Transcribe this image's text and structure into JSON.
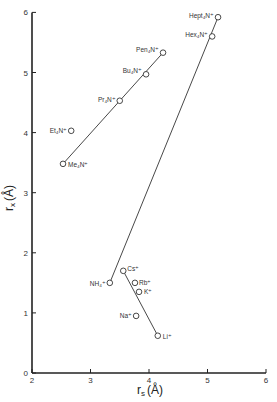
{
  "chart_data": {
    "type": "scatter",
    "title": "",
    "xlabel": "r_s (Å)",
    "ylabel": "r_x (Å)",
    "xlim": [
      2,
      6
    ],
    "ylim": [
      0,
      6
    ],
    "x_ticks": [
      "2",
      "3",
      "4",
      "5",
      "6"
    ],
    "y_ticks": [
      "0",
      "1",
      "2",
      "3",
      "4",
      "5",
      "6"
    ],
    "grid": false,
    "legend": null,
    "points": [
      {
        "label": "Hept₄N⁺",
        "x": 5.18,
        "y": 5.92
      },
      {
        "label": "Hex₄N⁺",
        "x": 5.08,
        "y": 5.6
      },
      {
        "label": "Pen₄N⁺",
        "x": 4.24,
        "y": 5.33
      },
      {
        "label": "Bu₄N⁺",
        "x": 3.95,
        "y": 4.97
      },
      {
        "label": "Pr₄N⁺",
        "x": 3.5,
        "y": 4.53
      },
      {
        "label": "Et₄N⁺",
        "x": 2.67,
        "y": 4.03
      },
      {
        "label": "Me₄N⁺",
        "x": 2.53,
        "y": 3.48
      },
      {
        "label": "NH₄⁺",
        "x": 3.33,
        "y": 1.5
      },
      {
        "label": "Cs⁺",
        "x": 3.56,
        "y": 1.7
      },
      {
        "label": "Rb⁺",
        "x": 3.76,
        "y": 1.5
      },
      {
        "label": "K⁺",
        "x": 3.83,
        "y": 1.35
      },
      {
        "label": "Na⁺",
        "x": 3.78,
        "y": 0.95
      },
      {
        "label": "Li⁺",
        "x": 4.15,
        "y": 0.62
      }
    ],
    "lines": [
      {
        "name": "tetraalkylammonium-fit",
        "from": [
          2.53,
          3.48
        ],
        "to": [
          4.24,
          5.33
        ]
      },
      {
        "name": "NH4-to-Hept-line",
        "from": [
          3.33,
          1.5
        ],
        "to": [
          5.18,
          5.92
        ]
      },
      {
        "name": "alkali-fit",
        "from": [
          3.56,
          1.7
        ],
        "to": [
          4.15,
          0.62
        ]
      }
    ]
  }
}
